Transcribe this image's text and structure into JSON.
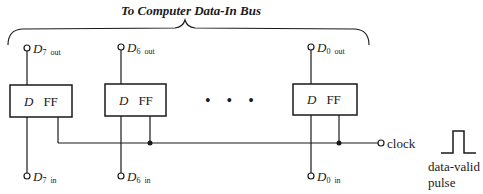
{
  "title": "To Computer Data-In Bus",
  "flipflops": [
    {
      "d_label": "D",
      "ff_label": "FF",
      "out_name": "D",
      "out_sub": "7",
      "out_suffix": "out",
      "in_name": "D",
      "in_sub": "7",
      "in_suffix": "in"
    },
    {
      "d_label": "D",
      "ff_label": "FF",
      "out_name": "D",
      "out_sub": "6",
      "out_suffix": "out",
      "in_name": "D",
      "in_sub": "6",
      "in_suffix": "in"
    },
    {
      "d_label": "D",
      "ff_label": "FF",
      "out_name": "D",
      "out_sub": "0",
      "out_suffix": "out",
      "in_name": "D",
      "in_sub": "0",
      "in_suffix": "in"
    }
  ],
  "ellipsis": "• • •",
  "clock_label": "clock",
  "pulse_label_line1": "data-valid",
  "pulse_label_line2": "pulse"
}
